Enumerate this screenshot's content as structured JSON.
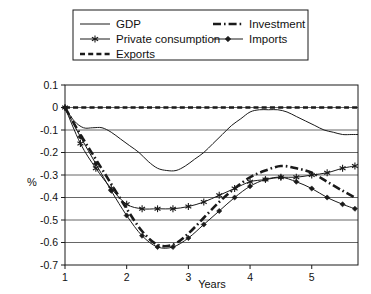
{
  "chart_data": {
    "type": "line",
    "title": "",
    "xlabel": "Years",
    "ylabel": "%",
    "xlim": [
      1,
      5.75
    ],
    "ylim": [
      -0.7,
      0.1
    ],
    "grid": true,
    "legend_position": "top",
    "y_ticks": [
      "0.1",
      "0",
      "-0.1",
      "-0.2",
      "-0.3",
      "-0.4",
      "-0.5",
      "-0.6",
      "-0.7"
    ],
    "y_tick_values": [
      0.1,
      0,
      -0.1,
      -0.2,
      -0.3,
      -0.4,
      -0.5,
      -0.6,
      -0.7
    ],
    "x_ticks": [
      "1",
      "2",
      "3",
      "4",
      "5"
    ],
    "x_tick_values": [
      1,
      2,
      3,
      4,
      5
    ],
    "series": [
      {
        "name": "GDP",
        "style": "solid-thin",
        "marker": "none",
        "color": "#1a1a1a",
        "x": [
          1.0,
          1.15,
          1.3,
          1.45,
          1.6,
          1.75,
          1.9,
          2.05,
          2.2,
          2.35,
          2.5,
          2.65,
          2.8,
          2.95,
          3.1,
          3.25,
          3.4,
          3.55,
          3.7,
          3.85,
          4.0,
          4.15,
          4.3,
          4.45,
          4.6,
          4.75,
          4.9,
          5.05,
          5.2,
          5.35,
          5.5,
          5.65,
          5.75
        ],
        "values": [
          0.0,
          -0.06,
          -0.09,
          -0.09,
          -0.09,
          -0.11,
          -0.14,
          -0.17,
          -0.2,
          -0.24,
          -0.27,
          -0.28,
          -0.28,
          -0.26,
          -0.23,
          -0.2,
          -0.16,
          -0.12,
          -0.08,
          -0.05,
          -0.02,
          -0.01,
          -0.01,
          -0.01,
          -0.02,
          -0.04,
          -0.06,
          -0.08,
          -0.1,
          -0.11,
          -0.12,
          -0.12,
          -0.12
        ]
      },
      {
        "name": "Private consumption",
        "style": "solid-thin",
        "marker": "asterisk",
        "color": "#1a1a1a",
        "x": [
          1.0,
          1.25,
          1.5,
          1.75,
          2.0,
          2.25,
          2.5,
          2.75,
          3.0,
          3.25,
          3.5,
          3.75,
          4.0,
          4.25,
          4.5,
          4.75,
          5.0,
          5.25,
          5.5,
          5.7
        ],
        "values": [
          0.0,
          -0.16,
          -0.27,
          -0.36,
          -0.43,
          -0.45,
          -0.45,
          -0.45,
          -0.44,
          -0.42,
          -0.39,
          -0.36,
          -0.33,
          -0.32,
          -0.31,
          -0.31,
          -0.3,
          -0.29,
          -0.27,
          -0.26
        ]
      },
      {
        "name": "Exports",
        "style": "dashed",
        "marker": "none",
        "color": "#1a1a1a",
        "x": [
          1.0,
          2.0,
          3.0,
          4.0,
          5.0,
          5.75
        ],
        "values": [
          0.0,
          0.0,
          0.0,
          0.0,
          0.0,
          0.0
        ]
      },
      {
        "name": "Investment",
        "style": "dash-dot",
        "marker": "none",
        "color": "#1a1a1a",
        "x": [
          1.0,
          1.25,
          1.5,
          1.75,
          2.0,
          2.25,
          2.5,
          2.75,
          3.0,
          3.25,
          3.5,
          3.75,
          4.0,
          4.25,
          4.5,
          4.75,
          5.0,
          5.25,
          5.5,
          5.7
        ],
        "values": [
          0.0,
          -0.12,
          -0.23,
          -0.34,
          -0.45,
          -0.55,
          -0.61,
          -0.61,
          -0.56,
          -0.49,
          -0.42,
          -0.36,
          -0.31,
          -0.28,
          -0.26,
          -0.27,
          -0.29,
          -0.33,
          -0.37,
          -0.4
        ]
      },
      {
        "name": "Imports",
        "style": "solid-thin",
        "marker": "diamond",
        "color": "#1a1a1a",
        "x": [
          1.0,
          1.25,
          1.5,
          1.75,
          2.0,
          2.25,
          2.5,
          2.75,
          3.0,
          3.25,
          3.5,
          3.75,
          4.0,
          4.25,
          4.5,
          4.75,
          5.0,
          5.25,
          5.5,
          5.7
        ],
        "values": [
          0.0,
          -0.13,
          -0.25,
          -0.37,
          -0.48,
          -0.57,
          -0.62,
          -0.62,
          -0.58,
          -0.52,
          -0.46,
          -0.4,
          -0.35,
          -0.32,
          -0.31,
          -0.33,
          -0.36,
          -0.4,
          -0.43,
          -0.45
        ]
      }
    ]
  },
  "legend": {
    "entries": [
      {
        "label": "GDP"
      },
      {
        "label": "Private consumption"
      },
      {
        "label": "Exports"
      },
      {
        "label": "Investment"
      },
      {
        "label": "Imports"
      }
    ]
  },
  "axes": {
    "y_title": "%",
    "x_title": "Years"
  }
}
